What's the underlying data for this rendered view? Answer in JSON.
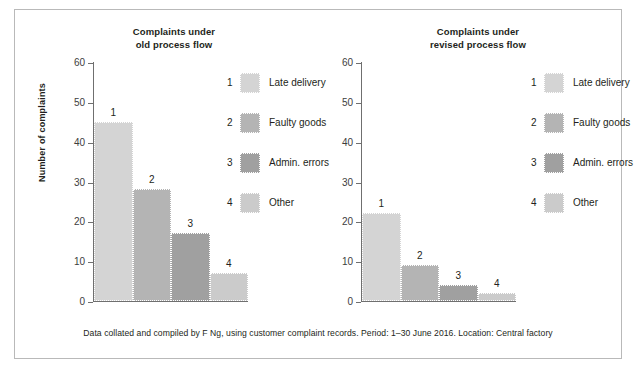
{
  "figure": {
    "caption": "Data collated and compiled by F Ng, using customer complaint records. Period: 1–30 June 2016. Location: Central factory",
    "y_axis_label": "Number of complaints"
  },
  "legend": {
    "items": [
      {
        "num": "1",
        "label": "Late delivery",
        "color": "#d4d4d4"
      },
      {
        "num": "2",
        "label": "Faulty goods",
        "color": "#b4b4b4"
      },
      {
        "num": "3",
        "label": "Admin. errors",
        "color": "#a0a0a0"
      },
      {
        "num": "4",
        "label": "Other",
        "color": "#cbcbcb"
      }
    ]
  },
  "chart_data": [
    {
      "type": "bar",
      "id": "old-process-flow",
      "title": "Complaints under old process flow",
      "title_line1": "Complaints under",
      "title_line2": "old process flow",
      "xlabel": "",
      "ylabel": "Number of complaints",
      "ylim": [
        0,
        60
      ],
      "yticks": [
        0,
        10,
        20,
        30,
        40,
        50,
        60
      ],
      "ytick_labels": [
        "0",
        "10",
        "20",
        "30",
        "40",
        "50",
        "60"
      ],
      "grid": false,
      "legend_position": "right",
      "categories": [
        "Late delivery",
        "Faulty goods",
        "Admin. errors",
        "Other"
      ],
      "category_numbers": [
        "1",
        "2",
        "3",
        "4"
      ],
      "values": [
        45,
        28,
        17,
        7
      ],
      "bar_labels": [
        "1",
        "2",
        "3",
        "4"
      ],
      "colors": [
        "#d4d4d4",
        "#b4b4b4",
        "#a0a0a0",
        "#cbcbcb"
      ]
    },
    {
      "type": "bar",
      "id": "revised-process-flow",
      "title": "Complaints under revised process flow",
      "title_line1": "Complaints under",
      "title_line2": "revised process flow",
      "xlabel": "",
      "ylabel": "",
      "ylim": [
        0,
        60
      ],
      "yticks": [
        0,
        10,
        20,
        30,
        40,
        50,
        60
      ],
      "ytick_labels": [
        "0",
        "10",
        "20",
        "30",
        "40",
        "50",
        "60"
      ],
      "grid": false,
      "legend_position": "right",
      "categories": [
        "Late delivery",
        "Faulty goods",
        "Admin. errors",
        "Other"
      ],
      "category_numbers": [
        "1",
        "2",
        "3",
        "4"
      ],
      "values": [
        22,
        9,
        4,
        2
      ],
      "bar_labels": [
        "1",
        "2",
        "3",
        "4"
      ],
      "colors": [
        "#d4d4d4",
        "#b4b4b4",
        "#a0a0a0",
        "#cbcbcb"
      ]
    }
  ]
}
